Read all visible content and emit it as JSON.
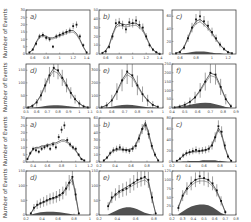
{
  "figure": {
    "ylabel": "Number of Events",
    "rows": 4,
    "cols": 3
  },
  "chart_data": [
    {
      "id": "top-a",
      "type": "bar",
      "label": "a)",
      "ylabel": "Number of Events",
      "xlim": [
        0.5,
        1.45
      ],
      "ylim": [
        0,
        30
      ],
      "xticks": [
        "0.6",
        "0.8",
        "1",
        "1.2",
        "1.4"
      ],
      "yticks": [
        "0",
        "5",
        "10",
        "15",
        "20",
        "25",
        "30"
      ],
      "x": [
        0.55,
        0.6,
        0.65,
        0.7,
        0.75,
        0.8,
        0.85,
        0.9,
        0.95,
        1.0,
        1.05,
        1.1,
        1.15,
        1.2,
        1.25,
        1.3,
        1.35,
        1.4
      ],
      "values": [
        1,
        3,
        7,
        12,
        13,
        11,
        10,
        5,
        12,
        13,
        14,
        15,
        16,
        19,
        20,
        12,
        6,
        1
      ],
      "fit": [
        1,
        3,
        8,
        12,
        13,
        12,
        11,
        11,
        12,
        13,
        14,
        15,
        16,
        16,
        14,
        10,
        5,
        1
      ]
    },
    {
      "id": "top-b",
      "type": "bar",
      "label": "b)",
      "ylabel": "",
      "xlim": [
        0.5,
        1.45
      ],
      "ylim": [
        0,
        50
      ],
      "xticks": [
        "0.6",
        "0.8",
        "1",
        "1.2",
        "1.4"
      ],
      "yticks": [
        "0",
        "10",
        "20",
        "30",
        "40",
        "50"
      ],
      "x": [
        0.55,
        0.6,
        0.65,
        0.7,
        0.75,
        0.8,
        0.85,
        0.9,
        0.95,
        1.0,
        1.05,
        1.1,
        1.15,
        1.2,
        1.25,
        1.3,
        1.35,
        1.4
      ],
      "values": [
        1,
        3,
        8,
        20,
        35,
        36,
        33,
        28,
        36,
        35,
        38,
        33,
        30,
        20,
        10,
        5,
        2,
        0
      ],
      "fit": [
        1,
        4,
        10,
        22,
        32,
        35,
        34,
        33,
        34,
        35,
        35,
        32,
        28,
        20,
        11,
        5,
        2,
        0
      ]
    },
    {
      "id": "top-c",
      "type": "bar",
      "label": "c)",
      "ylabel": "",
      "xlim": [
        0.5,
        1.3
      ],
      "ylim": [
        0,
        70
      ],
      "xticks": [
        "0.6",
        "0.8",
        "1",
        "1.2"
      ],
      "yticks": [
        "0",
        "20",
        "40",
        "60"
      ],
      "x": [
        0.55,
        0.6,
        0.65,
        0.7,
        0.75,
        0.8,
        0.85,
        0.9,
        0.95,
        1.0,
        1.05,
        1.1,
        1.15,
        1.2,
        1.25
      ],
      "values": [
        1,
        3,
        10,
        25,
        42,
        55,
        60,
        52,
        45,
        35,
        25,
        15,
        8,
        3,
        1
      ],
      "fit": [
        1,
        4,
        11,
        26,
        42,
        52,
        55,
        50,
        43,
        34,
        24,
        15,
        8,
        3,
        1
      ],
      "background": [
        0,
        0,
        1,
        2,
        3,
        4,
        4,
        4,
        3,
        2,
        1,
        1,
        0,
        0,
        0
      ]
    },
    {
      "id": "r2-d",
      "type": "bar",
      "label": "d)",
      "ylabel": "Number of Events",
      "xlim": [
        0.5,
        1.1
      ],
      "ylim": [
        0,
        175
      ],
      "xticks": [
        "0.5",
        "0.6",
        "0.7",
        "0.8",
        "0.9",
        "1",
        "1.1"
      ],
      "yticks": [
        "0",
        "50",
        "100",
        "150"
      ],
      "x": [
        0.52,
        0.56,
        0.6,
        0.64,
        0.68,
        0.72,
        0.76,
        0.8,
        0.84,
        0.88,
        0.92,
        0.96,
        1.0,
        1.04,
        1.08
      ],
      "values": [
        2,
        8,
        22,
        50,
        90,
        130,
        160,
        150,
        120,
        90,
        60,
        35,
        18,
        6,
        2
      ],
      "fit": [
        2,
        9,
        24,
        52,
        92,
        132,
        158,
        148,
        122,
        92,
        62,
        36,
        18,
        7,
        2
      ],
      "background": [
        0,
        1,
        3,
        5,
        8,
        10,
        11,
        11,
        10,
        8,
        6,
        4,
        2,
        1,
        0
      ]
    },
    {
      "id": "r2-e",
      "type": "bar",
      "label": "e)",
      "ylabel": "",
      "xlim": [
        0.5,
        1.0
      ],
      "ylim": [
        0,
        350
      ],
      "xticks": [
        "0.5",
        "0.6",
        "0.7",
        "0.8",
        "0.9",
        "1"
      ],
      "yticks": [
        "0",
        "100",
        "200",
        "300"
      ],
      "x": [
        0.52,
        0.56,
        0.6,
        0.64,
        0.68,
        0.72,
        0.76,
        0.8,
        0.84,
        0.88,
        0.92,
        0.96
      ],
      "values": [
        5,
        20,
        60,
        130,
        220,
        290,
        260,
        180,
        110,
        60,
        25,
        8
      ],
      "fit": [
        6,
        22,
        62,
        132,
        222,
        285,
        258,
        182,
        112,
        62,
        26,
        8
      ],
      "background": [
        1,
        4,
        10,
        18,
        24,
        26,
        24,
        18,
        12,
        6,
        3,
        1
      ]
    },
    {
      "id": "r2-f",
      "type": "bar",
      "label": "f)",
      "ylabel": "",
      "xlim": [
        0.4,
        0.9
      ],
      "ylim": [
        0,
        250
      ],
      "xticks": [
        "0.4",
        "0.5",
        "0.6",
        "0.7",
        "0.8",
        "0.9"
      ],
      "yticks": [
        "0",
        "50",
        "100",
        "150",
        "200",
        "250"
      ],
      "x": [
        0.42,
        0.46,
        0.5,
        0.54,
        0.58,
        0.62,
        0.66,
        0.7,
        0.74,
        0.78,
        0.82,
        0.86
      ],
      "values": [
        3,
        8,
        18,
        35,
        60,
        100,
        150,
        200,
        190,
        120,
        50,
        10
      ],
      "fit": [
        3,
        9,
        19,
        36,
        62,
        102,
        152,
        198,
        188,
        122,
        52,
        10
      ],
      "background": [
        2,
        6,
        12,
        18,
        24,
        28,
        30,
        28,
        22,
        14,
        6,
        2
      ]
    },
    {
      "id": "r3-a",
      "type": "bar",
      "label": "a)",
      "ylabel": "Number of Events",
      "xlim": [
        0.3,
        1.2
      ],
      "ylim": [
        0,
        30
      ],
      "xticks": [
        "0.4",
        "0.6",
        "0.8",
        "1",
        "1.2"
      ],
      "yticks": [
        "0",
        "5",
        "10",
        "15",
        "20",
        "25",
        "30"
      ],
      "x": [
        0.32,
        0.36,
        0.4,
        0.44,
        0.48,
        0.52,
        0.56,
        0.6,
        0.64,
        0.68,
        0.72,
        0.76,
        0.8,
        0.84,
        0.88,
        0.92,
        0.96,
        1.0,
        1.04,
        1.08,
        1.12
      ],
      "values": [
        2,
        6,
        9,
        8,
        7,
        9,
        10,
        11,
        9,
        12,
        10,
        17,
        22,
        25,
        15,
        12,
        10,
        9,
        5,
        2,
        1
      ],
      "fit": [
        2,
        6,
        9,
        10,
        10,
        11,
        11,
        12,
        12,
        13,
        13,
        14,
        15,
        15,
        14,
        12,
        10,
        8,
        5,
        2,
        1
      ]
    },
    {
      "id": "r3-b",
      "type": "bar",
      "label": "b)",
      "ylabel": "",
      "xlim": [
        0.2,
        1.0
      ],
      "ylim": [
        0,
        60
      ],
      "xticks": [
        "0.2",
        "0.4",
        "0.6",
        "0.8",
        "1"
      ],
      "yticks": [
        "0",
        "10",
        "20",
        "30",
        "40",
        "50",
        "60"
      ],
      "x": [
        0.26,
        0.3,
        0.34,
        0.38,
        0.42,
        0.46,
        0.5,
        0.54,
        0.58,
        0.62,
        0.66,
        0.7,
        0.74,
        0.78,
        0.82,
        0.86,
        0.9,
        0.94
      ],
      "values": [
        2,
        6,
        12,
        16,
        18,
        20,
        17,
        16,
        15,
        18,
        22,
        32,
        45,
        50,
        38,
        22,
        10,
        2
      ],
      "fit": [
        2,
        6,
        12,
        16,
        17,
        18,
        17,
        17,
        17,
        19,
        24,
        34,
        46,
        54,
        40,
        22,
        10,
        2
      ]
    },
    {
      "id": "r3-c",
      "type": "bar",
      "label": "c)",
      "ylabel": "",
      "xlim": [
        0.2,
        1.0
      ],
      "ylim": [
        0,
        80
      ],
      "xticks": [
        "0.2",
        "0.4",
        "0.6",
        "0.8",
        "1"
      ],
      "yticks": [
        "0",
        "20",
        "40",
        "60",
        "80"
      ],
      "x": [
        0.26,
        0.3,
        0.34,
        0.38,
        0.42,
        0.46,
        0.5,
        0.54,
        0.58,
        0.62,
        0.66,
        0.7,
        0.74,
        0.78,
        0.82,
        0.86,
        0.9,
        0.94
      ],
      "values": [
        2,
        6,
        12,
        16,
        18,
        20,
        22,
        20,
        21,
        22,
        24,
        30,
        45,
        65,
        55,
        30,
        10,
        2
      ],
      "fit": [
        2,
        6,
        12,
        16,
        18,
        19,
        20,
        20,
        21,
        22,
        25,
        32,
        46,
        62,
        52,
        28,
        10,
        2
      ],
      "background": [
        0,
        0,
        1,
        1,
        2,
        2,
        2,
        2,
        3,
        3,
        3,
        3,
        3,
        2,
        2,
        1,
        0,
        0
      ]
    },
    {
      "id": "r4-d",
      "type": "bar",
      "label": "d)",
      "ylabel": "Number of Events",
      "xlim": [
        0.2,
        1.0
      ],
      "ylim": [
        0,
        150
      ],
      "xticks": [
        "0.2",
        "0.4",
        "0.6",
        "0.8",
        "1"
      ],
      "yticks": [
        "0",
        "50",
        "100",
        "150"
      ],
      "x": [
        0.26,
        0.3,
        0.34,
        0.38,
        0.42,
        0.46,
        0.5,
        0.54,
        0.58,
        0.62,
        0.66,
        0.7,
        0.74,
        0.78,
        0.82,
        0.86
      ],
      "values": [
        5,
        25,
        35,
        40,
        45,
        50,
        55,
        58,
        62,
        68,
        75,
        90,
        110,
        130,
        70,
        5
      ],
      "fit": [
        5,
        24,
        34,
        40,
        45,
        50,
        55,
        58,
        62,
        68,
        76,
        92,
        112,
        128,
        70,
        5
      ],
      "background": [
        1,
        4,
        7,
        9,
        10,
        11,
        11,
        11,
        10,
        9,
        8,
        6,
        4,
        2,
        1,
        0
      ]
    },
    {
      "id": "r4-e",
      "type": "bar",
      "label": "e)",
      "ylabel": "",
      "xlim": [
        0.2,
        0.9
      ],
      "ylim": [
        0,
        150
      ],
      "xticks": [
        "0.2",
        "0.4",
        "0.6",
        "0.8"
      ],
      "yticks": [
        "0",
        "50",
        "100",
        "150"
      ],
      "x": [
        0.3,
        0.34,
        0.38,
        0.42,
        0.46,
        0.5,
        0.54,
        0.58,
        0.62,
        0.66,
        0.7,
        0.74,
        0.78,
        0.82
      ],
      "values": [
        30,
        60,
        70,
        80,
        85,
        90,
        100,
        110,
        120,
        125,
        130,
        120,
        60,
        5
      ],
      "fit": [
        30,
        58,
        70,
        80,
        88,
        95,
        103,
        110,
        118,
        124,
        128,
        118,
        58,
        5
      ],
      "background": [
        2,
        8,
        14,
        20,
        24,
        26,
        26,
        24,
        20,
        14,
        8,
        4,
        1,
        0
      ]
    },
    {
      "id": "r4-f",
      "type": "bar",
      "label": "f)",
      "ylabel": "",
      "xlim": [
        0.2,
        0.8
      ],
      "ylim": [
        0,
        125
      ],
      "xticks": [
        "0.2",
        "0.3",
        "0.4",
        "0.5",
        "0.6",
        "0.7",
        "0.8"
      ],
      "yticks": [
        "0",
        "25",
        "50",
        "75",
        "100",
        "125"
      ],
      "x": [
        0.26,
        0.3,
        0.34,
        0.38,
        0.42,
        0.46,
        0.5,
        0.54,
        0.58,
        0.62,
        0.66,
        0.7
      ],
      "values": [
        20,
        55,
        75,
        90,
        100,
        110,
        105,
        100,
        90,
        70,
        40,
        8
      ],
      "fit": [
        22,
        56,
        76,
        90,
        100,
        104,
        104,
        100,
        88,
        68,
        40,
        8
      ],
      "background": [
        2,
        10,
        18,
        24,
        28,
        30,
        30,
        28,
        22,
        14,
        6,
        1
      ]
    }
  ]
}
